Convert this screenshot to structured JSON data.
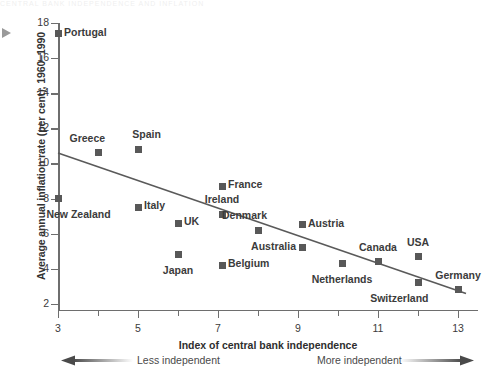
{
  "header_strip": "CENTRAL BANK INDEPENDENCE AND INFLATION",
  "chart_data": {
    "type": "scatter",
    "title": "",
    "xlabel": "Index of central bank independence",
    "ylabel": "Average annual inflation rate (per cent), 1960–1990",
    "xlim": [
      3,
      13.5
    ],
    "ylim": [
      1.6,
      18
    ],
    "xticks": [
      3,
      5,
      7,
      9,
      11,
      13
    ],
    "xticklabels": [
      "3",
      "5",
      "7",
      "9",
      "11",
      "13"
    ],
    "x_minor_ticks": [
      4,
      6,
      8,
      10,
      12
    ],
    "yticks": [
      2,
      4,
      6,
      8,
      10,
      12,
      14,
      16,
      18
    ],
    "yticklabels": [
      "2",
      "4",
      "6",
      "8",
      "10",
      "12",
      "14",
      "16",
      "18"
    ],
    "grid": false,
    "legend": null,
    "marker_color": "#585858",
    "line_color": "#5a5a5a",
    "axis_color": "#6e6e6e",
    "points": [
      {
        "label": "Portugal",
        "x": 3.0,
        "y": 17.4,
        "pos": "right"
      },
      {
        "label": "Greece",
        "x": 4.0,
        "y": 10.6,
        "pos": "above-left"
      },
      {
        "label": "Spain",
        "x": 5.0,
        "y": 10.8,
        "pos": "above-right"
      },
      {
        "label": "New Zealand",
        "x": 3.0,
        "y": 8.0,
        "pos": "below-right"
      },
      {
        "label": "Italy",
        "x": 5.0,
        "y": 7.5,
        "pos": "right"
      },
      {
        "label": "UK",
        "x": 6.0,
        "y": 6.6,
        "pos": "right"
      },
      {
        "label": "Japan",
        "x": 6.0,
        "y": 4.8,
        "pos": "below"
      },
      {
        "label": "France",
        "x": 7.1,
        "y": 8.7,
        "pos": "right"
      },
      {
        "label": "Ireland",
        "x": 7.1,
        "y": 7.1,
        "pos": "above"
      },
      {
        "label": "Belgium",
        "x": 7.1,
        "y": 4.2,
        "pos": "right"
      },
      {
        "label": "Denmark",
        "x": 8.0,
        "y": 6.2,
        "pos": "above-left"
      },
      {
        "label": "Australia",
        "x": 9.1,
        "y": 5.2,
        "pos": "left"
      },
      {
        "label": "Austria",
        "x": 9.1,
        "y": 6.5,
        "pos": "right"
      },
      {
        "label": "Netherlands",
        "x": 10.1,
        "y": 4.3,
        "pos": "below"
      },
      {
        "label": "Canada",
        "x": 11.0,
        "y": 4.4,
        "pos": "above"
      },
      {
        "label": "USA",
        "x": 12.0,
        "y": 4.7,
        "pos": "above"
      },
      {
        "label": "Switzerland",
        "x": 12.0,
        "y": 3.2,
        "pos": "below-left"
      },
      {
        "label": "Germany",
        "x": 13.0,
        "y": 2.8,
        "pos": "above"
      }
    ],
    "trendline": {
      "x1": 3.0,
      "y1": 10.6,
      "x2": 13.2,
      "y2": 2.6
    }
  },
  "annotations": {
    "less_independent": "Less independent",
    "more_independent": "More independent"
  }
}
